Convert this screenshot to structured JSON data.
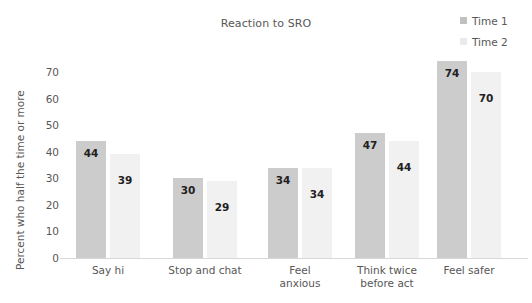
{
  "chart_data": {
    "type": "bar",
    "title": "Reaction to SRO",
    "xlabel": "",
    "ylabel": "Percent who half the time or more",
    "ylim": [
      0,
      70
    ],
    "yticks": [
      70,
      60,
      50,
      40,
      30,
      20,
      10,
      0
    ],
    "grid": false,
    "legend_position": "top-right",
    "categories": [
      "Say hi",
      "Stop and chat",
      "Feel anxious",
      "Think twice before act",
      "Feel safer"
    ],
    "series": [
      {
        "name": "Time 1",
        "color": "#cccccc",
        "values": [
          44,
          30,
          34,
          47,
          74
        ]
      },
      {
        "name": "Time 2",
        "color": "#f1f1f1",
        "values": [
          39,
          29,
          34,
          44,
          70
        ]
      }
    ]
  },
  "legend": {
    "items": [
      {
        "label": "Time 1",
        "swatch": "#c0c0c0"
      },
      {
        "label": "Time 2",
        "swatch": "#eaeaea"
      }
    ]
  },
  "xlabels_lines": [
    [
      "Say hi"
    ],
    [
      "Stop and chat"
    ],
    [
      "Feel",
      "anxious"
    ],
    [
      "Think twice",
      "before act"
    ],
    [
      "Feel safer"
    ]
  ]
}
